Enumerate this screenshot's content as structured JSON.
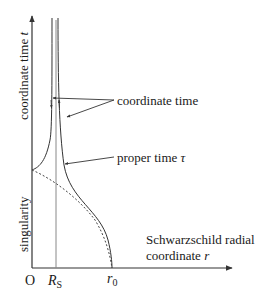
{
  "axes": {
    "y_label": "coordinate time",
    "y_symbol": "t",
    "y_lower_label": "singularity",
    "x_label_line1": "Schwarzschild radial",
    "x_label_line2": "coordinate",
    "x_symbol": "r",
    "origin_label": "O",
    "rs_symbol": "R",
    "rs_subscript": "S",
    "r0_symbol": "r",
    "r0_subscript": "0"
  },
  "annotations": {
    "coordinate_time": "coordinate time",
    "proper_time": "proper time",
    "proper_time_symbol": "τ"
  },
  "colors": {
    "curve": "#333333",
    "axis": "#333333",
    "rs_line": "#888888",
    "dashed": "#444444"
  }
}
